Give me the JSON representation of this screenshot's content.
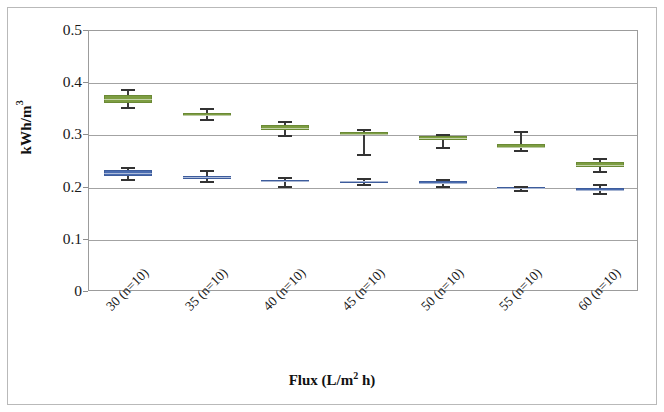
{
  "chart_data": {
    "type": "box",
    "title": "",
    "xlabel": "Flux (L/m2 h)",
    "xlabel_main": "Flux (L/m",
    "xlabel_sup": "2",
    "xlabel_tail": " h)",
    "ylabel": "kWh/m3",
    "ylabel_main": "kWh/m",
    "ylabel_sup": "3",
    "ylim": [
      0,
      0.5
    ],
    "ytick_labels": [
      "0.5",
      "0.4",
      "0.3",
      "0.2",
      "0.1",
      "0"
    ],
    "ytick_values": [
      0.5,
      0.4,
      0.3,
      0.2,
      0.1,
      0
    ],
    "grid": true,
    "legend": "none",
    "categories": [
      "30 (n=10)",
      "35 (n=10)",
      "40 (n=10)",
      "45 (n=10)",
      "50 (n=10)",
      "55 (n=10)",
      "60 (n=10)"
    ],
    "colors": {
      "green": "#7d9d42",
      "green_edge": "#6b8a35",
      "blue": "#4a6cb0",
      "blue_edge": "#3d5c9c",
      "whisker": "#333333",
      "gridline": "#a3a3a3",
      "axis": "#9c9c9c"
    },
    "series": [
      {
        "name": "green",
        "color": "#7d9d42",
        "boxes": [
          {
            "category": "30 (n=10)",
            "whisker_low": 0.354,
            "q1": 0.363,
            "median": 0.369,
            "q3": 0.377,
            "whisker_high": 0.389
          },
          {
            "category": "35 (n=10)",
            "whisker_low": 0.332,
            "q1": 0.338,
            "median": 0.34,
            "q3": 0.343,
            "whisker_high": 0.352
          },
          {
            "category": "40 (n=10)",
            "whisker_low": 0.3,
            "q1": 0.311,
            "median": 0.315,
            "q3": 0.32,
            "whisker_high": 0.328
          },
          {
            "category": "45 (n=10)",
            "whisker_low": 0.265,
            "q1": 0.3,
            "median": 0.303,
            "q3": 0.306,
            "whisker_high": 0.313
          },
          {
            "category": "50 (n=10)",
            "whisker_low": 0.277,
            "q1": 0.292,
            "median": 0.295,
            "q3": 0.298,
            "whisker_high": 0.302
          },
          {
            "category": "55 (n=10)",
            "whisker_low": 0.272,
            "q1": 0.275,
            "median": 0.278,
            "q3": 0.283,
            "whisker_high": 0.308
          },
          {
            "category": "60 (n=10)",
            "whisker_low": 0.231,
            "q1": 0.24,
            "median": 0.244,
            "q3": 0.25,
            "whisker_high": 0.256
          }
        ]
      },
      {
        "name": "blue",
        "color": "#4a6cb0",
        "boxes": [
          {
            "category": "30 (n=10)",
            "whisker_low": 0.216,
            "q1": 0.223,
            "median": 0.228,
            "q3": 0.233,
            "whisker_high": 0.24
          },
          {
            "category": "35 (n=10)",
            "whisker_low": 0.213,
            "q1": 0.22,
            "median": 0.221,
            "q3": 0.222,
            "whisker_high": 0.234
          },
          {
            "category": "40 (n=10)",
            "whisker_low": 0.203,
            "q1": 0.21,
            "median": 0.212,
            "q3": 0.215,
            "whisker_high": 0.221
          },
          {
            "category": "45 (n=10)",
            "whisker_low": 0.206,
            "q1": 0.211,
            "median": 0.212,
            "q3": 0.213,
            "whisker_high": 0.218
          },
          {
            "category": "50 (n=10)",
            "whisker_low": 0.203,
            "q1": 0.206,
            "median": 0.209,
            "q3": 0.213,
            "whisker_high": 0.217
          },
          {
            "category": "55 (n=10)",
            "whisker_low": 0.195,
            "q1": 0.197,
            "median": 0.199,
            "q3": 0.202,
            "whisker_high": 0.204
          },
          {
            "category": "60 (n=10)",
            "whisker_low": 0.19,
            "q1": 0.194,
            "median": 0.196,
            "q3": 0.199,
            "whisker_high": 0.206
          }
        ]
      }
    ]
  }
}
